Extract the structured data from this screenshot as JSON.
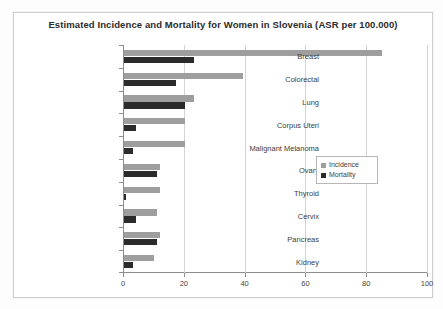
{
  "chart_data": {
    "type": "bar",
    "orientation": "horizontal",
    "title": "Estimated Incidence and Mortality for Women in Slovenia (ASR per 100.000)",
    "xlabel": "",
    "ylabel": "",
    "xlim": [
      0,
      100
    ],
    "xticks": [
      0,
      20,
      40,
      60,
      80,
      100
    ],
    "grid": true,
    "legend_position": "right-middle",
    "categories": [
      "Breast",
      "Colorectal",
      "Lung",
      "Corpus Uteri",
      "Malignant Melanoma",
      "Ovary",
      "Thyroid",
      "Cervix",
      "Pancreas",
      "Kidney"
    ],
    "series": [
      {
        "name": "Incidence",
        "color": "#9e9e9e",
        "values": [
          85,
          39,
          23,
          20,
          20,
          12,
          12,
          11,
          12,
          10
        ]
      },
      {
        "name": "Mortality",
        "color": "#2b2b2b",
        "values": [
          23,
          17,
          20,
          4,
          3,
          11,
          0.5,
          4,
          11,
          3
        ]
      }
    ]
  },
  "legend": {
    "items": [
      {
        "label": "Incidence",
        "color": "#9e9e9e"
      },
      {
        "label": "Mortality",
        "color": "#2b2b2b"
      }
    ]
  },
  "axis": {
    "tick_labels": [
      "0",
      "20",
      "40",
      "60",
      "80",
      "100"
    ]
  }
}
